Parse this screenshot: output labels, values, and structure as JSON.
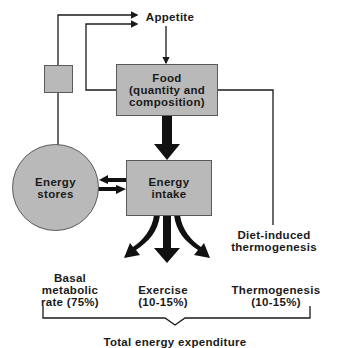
{
  "diagram": {
    "nodes": {
      "appetite": "Appetite",
      "food": [
        "Food",
        "(quantity and",
        "composition)"
      ],
      "energy_intake": [
        "Energy",
        "intake"
      ],
      "energy_stores": [
        "Energy",
        "stores"
      ],
      "diet_induced": [
        "Diet-induced",
        "thermogenesis"
      ],
      "basal": [
        "Basal",
        "metabolic",
        "rate (75%)"
      ],
      "exercise": [
        "Exercise",
        "(10-15%)"
      ],
      "thermogenesis": [
        "Thermogenesis",
        "(10-15%)"
      ],
      "total": "Total energy expenditure"
    },
    "colors": {
      "node_fill": "#b9b9b9",
      "node_border": "#5a5a5a",
      "line": "#1a1a1a"
    }
  }
}
